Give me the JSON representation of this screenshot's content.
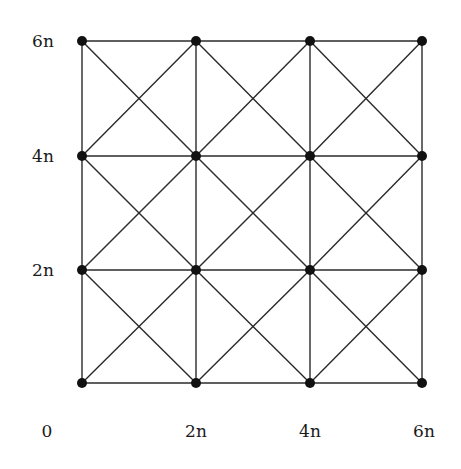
{
  "diagram": {
    "type": "grid-graph",
    "colors": {
      "line": "#2a2a2a",
      "node": "#111111",
      "background": "#ffffff"
    },
    "x_labels": [
      "0",
      "2n",
      "4n",
      "6n"
    ],
    "y_labels": [
      "6n",
      "4n",
      "2n"
    ],
    "grid": {
      "xs": [
        82,
        196,
        310,
        422
      ],
      "ys": [
        41,
        156,
        270,
        383
      ]
    },
    "label_positions": {
      "x": [
        {
          "text": "0",
          "x": 47,
          "y": 437
        },
        {
          "text": "2n",
          "x": 196,
          "y": 437
        },
        {
          "text": "4n",
          "x": 310,
          "y": 437
        },
        {
          "text": "6n",
          "x": 424,
          "y": 437
        }
      ],
      "y": [
        {
          "text": "6n",
          "x": 43,
          "y": 47
        },
        {
          "text": "4n",
          "x": 43,
          "y": 162
        },
        {
          "text": "2n",
          "x": 43,
          "y": 276
        }
      ]
    }
  }
}
